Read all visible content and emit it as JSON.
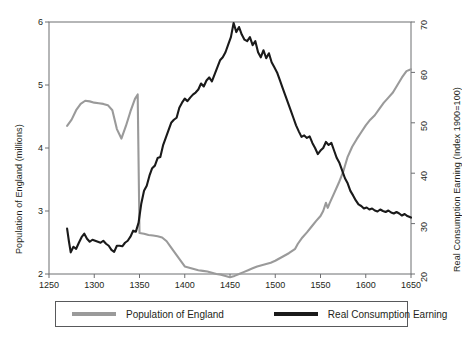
{
  "chart_data": {
    "type": "line",
    "title": "",
    "xlabel": "",
    "ylabel": "Population of England (millions)",
    "y2label": "Real Consumption Earning (Index 1900=100)",
    "xlim": [
      1250,
      1650
    ],
    "ylim": [
      2,
      6
    ],
    "y2lim": [
      20,
      70
    ],
    "grid": false,
    "legend_position": "bottom",
    "xticks": [
      "1250",
      "1300",
      "1350",
      "1400",
      "1450",
      "1500",
      "1550",
      "1600",
      "1650"
    ],
    "yticks_left": [
      "2",
      "3",
      "4",
      "5",
      "6"
    ],
    "yticks_right": [
      "20",
      "30",
      "40",
      "50",
      "60",
      "70"
    ],
    "series": [
      {
        "name": "Population of England",
        "axis": "left",
        "color": "#9a9a9a",
        "units": "millions",
        "x": [
          1270,
          1275,
          1280,
          1285,
          1290,
          1295,
          1300,
          1305,
          1310,
          1315,
          1320,
          1325,
          1330,
          1335,
          1340,
          1345,
          1348,
          1350,
          1355,
          1360,
          1365,
          1370,
          1375,
          1380,
          1385,
          1390,
          1395,
          1400,
          1405,
          1410,
          1415,
          1420,
          1425,
          1430,
          1435,
          1440,
          1445,
          1450,
          1455,
          1460,
          1465,
          1470,
          1475,
          1480,
          1485,
          1490,
          1495,
          1500,
          1505,
          1510,
          1515,
          1520,
          1522,
          1525,
          1530,
          1535,
          1540,
          1545,
          1550,
          1553,
          1556,
          1558,
          1560,
          1565,
          1570,
          1575,
          1580,
          1585,
          1590,
          1595,
          1600,
          1605,
          1610,
          1615,
          1620,
          1625,
          1630,
          1635,
          1640,
          1645,
          1650
        ],
        "values": [
          4.35,
          4.45,
          4.6,
          4.7,
          4.75,
          4.74,
          4.72,
          4.71,
          4.7,
          4.68,
          4.6,
          4.3,
          4.15,
          4.35,
          4.58,
          4.78,
          4.85,
          2.65,
          2.64,
          2.62,
          2.61,
          2.6,
          2.58,
          2.52,
          2.42,
          2.32,
          2.22,
          2.12,
          2.1,
          2.08,
          2.06,
          2.05,
          2.04,
          2.02,
          2.0,
          1.99,
          1.97,
          1.95,
          1.97,
          2.0,
          2.03,
          2.06,
          2.09,
          2.12,
          2.14,
          2.16,
          2.18,
          2.21,
          2.25,
          2.29,
          2.33,
          2.38,
          2.4,
          2.48,
          2.58,
          2.66,
          2.75,
          2.84,
          2.92,
          3.0,
          3.13,
          3.05,
          3.12,
          3.28,
          3.44,
          3.62,
          3.86,
          4.02,
          4.14,
          4.25,
          4.36,
          4.45,
          4.52,
          4.62,
          4.72,
          4.8,
          4.88,
          5.0,
          5.12,
          5.22,
          5.25
        ]
      },
      {
        "name": "Real Consumption Earning",
        "axis": "right",
        "color": "#1a1a1a",
        "units": "index 1900=100",
        "x": [
          1270,
          1272,
          1274,
          1277,
          1280,
          1283,
          1286,
          1289,
          1292,
          1295,
          1298,
          1301,
          1304,
          1307,
          1310,
          1313,
          1316,
          1319,
          1322,
          1325,
          1328,
          1331,
          1334,
          1337,
          1340,
          1343,
          1346,
          1349,
          1352,
          1355,
          1358,
          1361,
          1364,
          1367,
          1370,
          1373,
          1376,
          1379,
          1382,
          1385,
          1388,
          1391,
          1394,
          1397,
          1400,
          1403,
          1406,
          1409,
          1412,
          1415,
          1418,
          1421,
          1424,
          1427,
          1430,
          1433,
          1436,
          1439,
          1442,
          1445,
          1448,
          1451,
          1454,
          1457,
          1460,
          1463,
          1466,
          1469,
          1472,
          1475,
          1478,
          1481,
          1484,
          1487,
          1490,
          1493,
          1496,
          1499,
          1502,
          1505,
          1508,
          1511,
          1514,
          1517,
          1520,
          1523,
          1526,
          1529,
          1532,
          1535,
          1538,
          1541,
          1544,
          1547,
          1550,
          1553,
          1556,
          1559,
          1562,
          1565,
          1568,
          1571,
          1574,
          1577,
          1580,
          1583,
          1586,
          1589,
          1592,
          1595,
          1598,
          1601,
          1604,
          1607,
          1610,
          1613,
          1616,
          1619,
          1622,
          1625,
          1628,
          1631,
          1634,
          1637,
          1640,
          1643,
          1646,
          1650
        ],
        "values": [
          29.0,
          26.5,
          24.3,
          25.4,
          25.0,
          26.2,
          27.3,
          28.0,
          27.0,
          26.4,
          26.8,
          26.6,
          26.4,
          26.2,
          26.6,
          26.0,
          25.6,
          24.8,
          24.4,
          25.6,
          25.6,
          25.5,
          26.2,
          26.6,
          27.4,
          28.6,
          28.4,
          30.2,
          34.0,
          36.5,
          37.5,
          39.5,
          41.0,
          41.5,
          43.0,
          43.2,
          45.5,
          47.0,
          48.5,
          50.0,
          50.6,
          51.0,
          53.0,
          54.0,
          54.8,
          54.3,
          55.0,
          55.6,
          56.0,
          56.6,
          57.8,
          57.2,
          58.4,
          59.0,
          58.2,
          59.6,
          61.0,
          62.4,
          63.0,
          64.0,
          65.5,
          67.0,
          69.8,
          68.0,
          69.0,
          67.5,
          66.5,
          66.2,
          67.0,
          65.4,
          66.2,
          64.0,
          63.0,
          64.4,
          62.8,
          63.8,
          62.0,
          61.0,
          60.0,
          58.5,
          57.0,
          55.5,
          54.0,
          52.5,
          51.0,
          49.5,
          48.3,
          47.2,
          47.5,
          47.0,
          47.3,
          46.0,
          45.0,
          43.8,
          44.5,
          45.0,
          46.2,
          45.6,
          46.0,
          44.5,
          43.0,
          42.0,
          40.5,
          39.0,
          38.0,
          36.5,
          35.6,
          34.6,
          33.8,
          33.5,
          33.0,
          33.2,
          32.8,
          33.0,
          32.6,
          32.4,
          32.8,
          32.5,
          32.3,
          32.6,
          32.2,
          32.0,
          32.3,
          32.0,
          31.6,
          31.9,
          31.5,
          31.2
        ]
      }
    ]
  },
  "legend": {
    "entries": [
      {
        "label": "Population of England",
        "color": "#9a9a9a"
      },
      {
        "label": "Real Consumption Earning",
        "color": "#1a1a1a"
      }
    ]
  }
}
